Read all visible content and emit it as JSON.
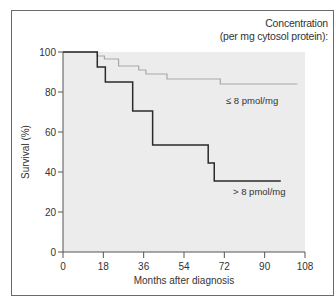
{
  "chart_data": {
    "type": "line",
    "subtype": "kaplan-meier step survival curve",
    "title": "",
    "legend_title": [
      "Concentration",
      "(per mg cytosol protein):"
    ],
    "xlabel": "Months after diagnosis",
    "ylabel": "Survival (%)",
    "xlim": [
      0,
      108
    ],
    "ylim": [
      0,
      100
    ],
    "x_ticks": [
      0,
      18,
      36,
      54,
      72,
      90,
      108
    ],
    "y_ticks": [
      0,
      20,
      40,
      60,
      80,
      100
    ],
    "grid": false,
    "series": [
      {
        "name": "≤ 8 pmol/mg",
        "color": "#a8a8a8",
        "steps": [
          {
            "x": 0,
            "y": 100
          },
          {
            "x": 15.3,
            "y": 98
          },
          {
            "x": 18.5,
            "y": 96.5
          },
          {
            "x": 24.8,
            "y": 93
          },
          {
            "x": 33.8,
            "y": 91
          },
          {
            "x": 37,
            "y": 89
          },
          {
            "x": 46.4,
            "y": 86.5
          },
          {
            "x": 70.2,
            "y": 84
          },
          {
            "x": 104.6,
            "y": 84
          }
        ]
      },
      {
        "name": "> 8 pmol/mg",
        "color": "#2a2a2a",
        "steps": [
          {
            "x": 0,
            "y": 100
          },
          {
            "x": 15.3,
            "y": 92.5
          },
          {
            "x": 18.9,
            "y": 85
          },
          {
            "x": 31.1,
            "y": 70.5
          },
          {
            "x": 40,
            "y": 53.5
          },
          {
            "x": 64.8,
            "y": 44.5
          },
          {
            "x": 67.5,
            "y": 35.5
          },
          {
            "x": 97.2,
            "y": 35.5
          }
        ]
      }
    ]
  },
  "legend": {
    "title_line1": "Concentration",
    "title_line2": "(per mg cytosol protein):"
  },
  "labels": {
    "low_series": "≤ 8 pmol/mg",
    "high_series": "> 8 pmol/mg",
    "xlabel": "Months after diagnosis",
    "ylabel": "Survival (%)"
  },
  "ticks": {
    "x": [
      "0",
      "18",
      "36",
      "54",
      "72",
      "90",
      "108"
    ],
    "y": [
      "0",
      "20",
      "40",
      "60",
      "80",
      "100"
    ]
  },
  "colors": {
    "plot_background": "#ececec",
    "frame": "#6a6a6a",
    "axis": "#555555",
    "low_series": "#a8a8a8",
    "high_series": "#2a2a2a"
  }
}
